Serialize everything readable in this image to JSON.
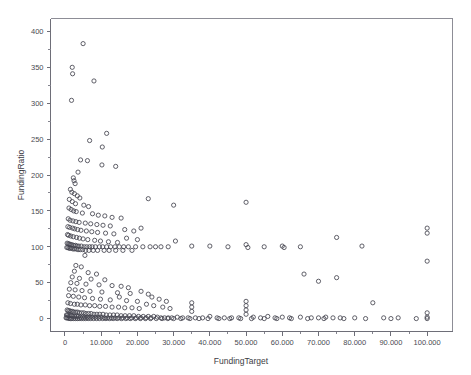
{
  "chart_data": {
    "type": "scatter",
    "title": "",
    "subtitle": "",
    "xlabel": "FundingTarget",
    "ylabel": "FundingRatio",
    "xlim": [
      -4000,
      107000
    ],
    "ylim": [
      -18,
      418
    ],
    "grid": false,
    "legend": null,
    "marker": "open-circle",
    "marker_color": "#45454f",
    "background_color": "#ffffff",
    "frame_color": "#8d8d96",
    "x_ticks": [
      0,
      10000,
      20000,
      30000,
      40000,
      50000,
      60000,
      70000,
      80000,
      90000,
      100000
    ],
    "x_tick_labels": [
      "0",
      "10.000",
      "20.000",
      "30.000",
      "40.000",
      "50.000",
      "60.000",
      "70.000",
      "80.000",
      "90.000",
      "100.000"
    ],
    "y_ticks": [
      0,
      50,
      100,
      150,
      200,
      250,
      300,
      350,
      400
    ],
    "y_tick_labels": [
      "0",
      "50",
      "100",
      "150",
      "200",
      "250",
      "300",
      "350",
      "400"
    ],
    "x_minor_ticks": [
      5000,
      15000,
      25000,
      35000,
      45000,
      55000,
      65000,
      75000,
      85000,
      95000
    ],
    "y_minor_ticks": [
      25,
      75,
      125,
      175,
      225,
      275,
      325,
      375
    ],
    "points": [
      [
        5000,
        383
      ],
      [
        2000,
        350
      ],
      [
        2100,
        341
      ],
      [
        8000,
        331
      ],
      [
        1800,
        304
      ],
      [
        11500,
        258
      ],
      [
        6800,
        248
      ],
      [
        10300,
        239
      ],
      [
        4300,
        221
      ],
      [
        6200,
        220
      ],
      [
        10200,
        214
      ],
      [
        3600,
        204
      ],
      [
        2300,
        196
      ],
      [
        2500,
        192
      ],
      [
        2800,
        188
      ],
      [
        14000,
        212
      ],
      [
        50000,
        162
      ],
      [
        23000,
        167
      ],
      [
        30000,
        158
      ],
      [
        1500,
        180
      ],
      [
        1900,
        176
      ],
      [
        2600,
        174
      ],
      [
        3400,
        171
      ],
      [
        4100,
        168
      ],
      [
        1200,
        166
      ],
      [
        2000,
        163
      ],
      [
        2900,
        160
      ],
      [
        5200,
        158
      ],
      [
        6500,
        156
      ],
      [
        1100,
        154
      ],
      [
        1700,
        152
      ],
      [
        2400,
        150
      ],
      [
        3100,
        149
      ],
      [
        4800,
        147
      ],
      [
        7600,
        146
      ],
      [
        9200,
        144
      ],
      [
        11000,
        143
      ],
      [
        13000,
        141
      ],
      [
        15500,
        140
      ],
      [
        900,
        139
      ],
      [
        1400,
        137
      ],
      [
        2200,
        136
      ],
      [
        3000,
        135
      ],
      [
        3900,
        134
      ],
      [
        5600,
        133
      ],
      [
        7100,
        132
      ],
      [
        8800,
        131
      ],
      [
        10500,
        130
      ],
      [
        12500,
        129
      ],
      [
        800,
        128
      ],
      [
        1300,
        127
      ],
      [
        2100,
        126
      ],
      [
        2700,
        125
      ],
      [
        3500,
        124
      ],
      [
        4400,
        123
      ],
      [
        5900,
        122
      ],
      [
        7400,
        121
      ],
      [
        9000,
        120
      ],
      [
        11200,
        119
      ],
      [
        13500,
        118
      ],
      [
        16500,
        124
      ],
      [
        19000,
        122
      ],
      [
        21000,
        126
      ],
      [
        700,
        117
      ],
      [
        1000,
        116
      ],
      [
        1600,
        115
      ],
      [
        2300,
        114
      ],
      [
        3200,
        113
      ],
      [
        4000,
        112
      ],
      [
        5000,
        111
      ],
      [
        6300,
        110
      ],
      [
        8200,
        109
      ],
      [
        9800,
        108
      ],
      [
        12000,
        107
      ],
      [
        14500,
        106
      ],
      [
        17000,
        112
      ],
      [
        20000,
        110
      ],
      [
        600,
        105
      ],
      [
        900,
        104
      ],
      [
        1200,
        104
      ],
      [
        1500,
        103
      ],
      [
        1900,
        103
      ],
      [
        2400,
        102
      ],
      [
        2900,
        102
      ],
      [
        3300,
        101
      ],
      [
        3800,
        101
      ],
      [
        4500,
        101
      ],
      [
        5300,
        100
      ],
      [
        6000,
        100
      ],
      [
        6800,
        100
      ],
      [
        7500,
        100
      ],
      [
        8400,
        100
      ],
      [
        9500,
        100
      ],
      [
        10400,
        100
      ],
      [
        11500,
        100
      ],
      [
        12600,
        100
      ],
      [
        13800,
        100
      ],
      [
        15000,
        100
      ],
      [
        16200,
        100
      ],
      [
        17500,
        100
      ],
      [
        19500,
        100
      ],
      [
        21500,
        100
      ],
      [
        23500,
        100
      ],
      [
        25000,
        100
      ],
      [
        26500,
        100
      ],
      [
        28500,
        100
      ],
      [
        500,
        99
      ],
      [
        800,
        99
      ],
      [
        1100,
        98
      ],
      [
        1400,
        98
      ],
      [
        1800,
        98
      ],
      [
        2200,
        97
      ],
      [
        2600,
        97
      ],
      [
        3100,
        97
      ],
      [
        3600,
        96
      ],
      [
        4200,
        96
      ],
      [
        4900,
        96
      ],
      [
        5700,
        95
      ],
      [
        6600,
        95
      ],
      [
        7800,
        95
      ],
      [
        9000,
        95
      ],
      [
        10800,
        95
      ],
      [
        12200,
        95
      ],
      [
        14000,
        95
      ],
      [
        16000,
        95
      ],
      [
        18500,
        95
      ],
      [
        35000,
        101
      ],
      [
        40000,
        101
      ],
      [
        45000,
        100
      ],
      [
        50000,
        103
      ],
      [
        50500,
        99
      ],
      [
        55000,
        100
      ],
      [
        60000,
        101
      ],
      [
        60500,
        99
      ],
      [
        65000,
        100
      ],
      [
        75000,
        113
      ],
      [
        82000,
        101
      ],
      [
        100000,
        126
      ],
      [
        100000,
        119
      ],
      [
        30500,
        108
      ],
      [
        5500,
        88
      ],
      [
        3000,
        74
      ],
      [
        4500,
        72
      ],
      [
        2600,
        66
      ],
      [
        6400,
        64
      ],
      [
        8700,
        62
      ],
      [
        2000,
        58
      ],
      [
        4000,
        56
      ],
      [
        7200,
        55
      ],
      [
        11000,
        54
      ],
      [
        1600,
        50
      ],
      [
        3300,
        49
      ],
      [
        5800,
        48
      ],
      [
        9400,
        47
      ],
      [
        13000,
        46
      ],
      [
        66000,
        62
      ],
      [
        70000,
        52
      ],
      [
        75000,
        57
      ],
      [
        100000,
        80
      ],
      [
        15500,
        45
      ],
      [
        17500,
        43
      ],
      [
        1200,
        41
      ],
      [
        2800,
        40
      ],
      [
        4700,
        39
      ],
      [
        6900,
        38
      ],
      [
        10200,
        37
      ],
      [
        14500,
        36
      ],
      [
        18000,
        35
      ],
      [
        21000,
        38
      ],
      [
        23000,
        34
      ],
      [
        1000,
        32
      ],
      [
        2300,
        31
      ],
      [
        3800,
        30
      ],
      [
        5400,
        29
      ],
      [
        7600,
        28
      ],
      [
        9800,
        27
      ],
      [
        12500,
        26
      ],
      [
        15000,
        30
      ],
      [
        17000,
        25
      ],
      [
        20000,
        24
      ],
      [
        24000,
        30
      ],
      [
        26000,
        27
      ],
      [
        28000,
        24
      ],
      [
        800,
        22
      ],
      [
        1500,
        21
      ],
      [
        2600,
        20
      ],
      [
        3400,
        20
      ],
      [
        4400,
        19
      ],
      [
        5600,
        19
      ],
      [
        6800,
        18
      ],
      [
        8200,
        18
      ],
      [
        9600,
        17
      ],
      [
        11200,
        17
      ],
      [
        13000,
        16
      ],
      [
        14800,
        16
      ],
      [
        16500,
        15
      ],
      [
        18500,
        15
      ],
      [
        20500,
        14
      ],
      [
        22500,
        20
      ],
      [
        24500,
        18
      ],
      [
        27000,
        16
      ],
      [
        29000,
        14
      ],
      [
        35000,
        22
      ],
      [
        35000,
        16
      ],
      [
        35000,
        10
      ],
      [
        50000,
        24
      ],
      [
        50000,
        18
      ],
      [
        50000,
        12
      ],
      [
        50000,
        6
      ],
      [
        85000,
        22
      ],
      [
        600,
        12
      ],
      [
        900,
        11
      ],
      [
        1300,
        11
      ],
      [
        1700,
        10
      ],
      [
        2100,
        10
      ],
      [
        2500,
        9
      ],
      [
        3000,
        9
      ],
      [
        3500,
        9
      ],
      [
        4000,
        8
      ],
      [
        4600,
        8
      ],
      [
        5200,
        8
      ],
      [
        5800,
        7
      ],
      [
        6500,
        7
      ],
      [
        7200,
        7
      ],
      [
        8000,
        6
      ],
      [
        8800,
        6
      ],
      [
        9600,
        6
      ],
      [
        10500,
        6
      ],
      [
        11400,
        5
      ],
      [
        12400,
        5
      ],
      [
        13400,
        5
      ],
      [
        14400,
        5
      ],
      [
        15500,
        4
      ],
      [
        16600,
        4
      ],
      [
        17800,
        4
      ],
      [
        19000,
        4
      ],
      [
        20300,
        3
      ],
      [
        21600,
        3
      ],
      [
        23000,
        3
      ],
      [
        24500,
        3
      ],
      [
        400,
        5
      ],
      [
        700,
        5
      ],
      [
        1000,
        4
      ],
      [
        1400,
        4
      ],
      [
        1800,
        4
      ],
      [
        2200,
        3
      ],
      [
        2700,
        3
      ],
      [
        3200,
        3
      ],
      [
        3700,
        3
      ],
      [
        4300,
        2
      ],
      [
        4900,
        2
      ],
      [
        5500,
        2
      ],
      [
        6200,
        2
      ],
      [
        6900,
        2
      ],
      [
        7600,
        2
      ],
      [
        8400,
        2
      ],
      [
        9200,
        2
      ],
      [
        10000,
        2
      ],
      [
        10900,
        1
      ],
      [
        11800,
        1
      ],
      [
        12800,
        1
      ],
      [
        13800,
        1
      ],
      [
        14900,
        1
      ],
      [
        16000,
        1
      ],
      [
        17200,
        1
      ],
      [
        18400,
        1
      ],
      [
        19700,
        1
      ],
      [
        21000,
        1
      ],
      [
        22400,
        1
      ],
      [
        23800,
        1
      ],
      [
        25500,
        2
      ],
      [
        26500,
        1
      ],
      [
        27500,
        1
      ],
      [
        28500,
        1
      ],
      [
        29500,
        1
      ],
      [
        31000,
        2
      ],
      [
        32500,
        1
      ],
      [
        34000,
        1
      ],
      [
        36000,
        1
      ],
      [
        38000,
        1
      ],
      [
        40000,
        3
      ],
      [
        42000,
        1
      ],
      [
        44000,
        1
      ],
      [
        46000,
        1
      ],
      [
        48000,
        1
      ],
      [
        52000,
        2
      ],
      [
        54000,
        1
      ],
      [
        56000,
        3
      ],
      [
        58000,
        1
      ],
      [
        60000,
        2
      ],
      [
        62000,
        1
      ],
      [
        65000,
        2
      ],
      [
        68000,
        1
      ],
      [
        70000,
        1
      ],
      [
        72000,
        2
      ],
      [
        74000,
        1
      ],
      [
        76000,
        1
      ],
      [
        80000,
        1
      ],
      [
        88000,
        1
      ],
      [
        92000,
        1
      ],
      [
        100000,
        8
      ],
      [
        100000,
        2
      ],
      [
        300,
        1
      ],
      [
        500,
        1
      ],
      [
        800,
        1
      ],
      [
        1100,
        0
      ],
      [
        1500,
        0
      ],
      [
        1900,
        0
      ],
      [
        2400,
        0
      ],
      [
        2900,
        0
      ],
      [
        3400,
        0
      ],
      [
        3900,
        0
      ],
      [
        4500,
        0
      ],
      [
        5100,
        0
      ],
      [
        5700,
        0
      ],
      [
        6400,
        0
      ],
      [
        7100,
        0
      ],
      [
        7900,
        0
      ],
      [
        8700,
        0
      ],
      [
        9500,
        0
      ],
      [
        10400,
        0
      ],
      [
        11300,
        0
      ],
      [
        12300,
        0
      ],
      [
        13300,
        0
      ],
      [
        14400,
        0
      ],
      [
        15600,
        0
      ],
      [
        16800,
        0
      ],
      [
        18000,
        0
      ],
      [
        19400,
        0
      ],
      [
        20800,
        0
      ],
      [
        22200,
        0
      ],
      [
        23600,
        0
      ],
      [
        25200,
        0
      ],
      [
        26800,
        0
      ],
      [
        28400,
        0
      ],
      [
        30000,
        0
      ],
      [
        32000,
        0
      ],
      [
        34500,
        0
      ],
      [
        37000,
        0
      ],
      [
        39500,
        0
      ],
      [
        42500,
        0
      ],
      [
        45500,
        0
      ],
      [
        48500,
        0
      ],
      [
        51500,
        0
      ],
      [
        55000,
        0
      ],
      [
        58500,
        0
      ],
      [
        62500,
        0
      ],
      [
        67000,
        0
      ],
      [
        71500,
        0
      ],
      [
        77000,
        0
      ],
      [
        83000,
        0
      ],
      [
        90000,
        0
      ],
      [
        97000,
        0
      ],
      [
        100000,
        0
      ]
    ]
  }
}
